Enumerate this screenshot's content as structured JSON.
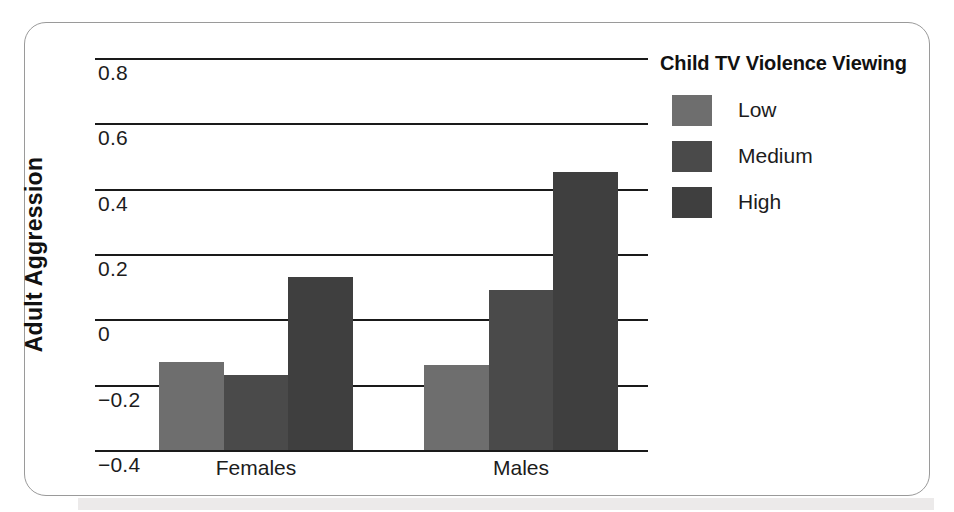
{
  "chart_data": {
    "type": "bar",
    "title": "",
    "xlabel": "",
    "ylabel": "Adult Aggression",
    "categories": [
      "Females",
      "Males"
    ],
    "ylim": [
      -0.4,
      0.8
    ],
    "yticks": [
      "0.8",
      "0.6",
      "0.4",
      "0.2",
      "0",
      "−0.2",
      "−0.4"
    ],
    "ytick_values": [
      0.8,
      0.6,
      0.4,
      0.2,
      0,
      -0.2,
      -0.4
    ],
    "grid": true,
    "legend_position": "right",
    "legend_title": "Child TV Violence Viewing",
    "series": [
      {
        "name": "Low",
        "color": "#6e6e6e",
        "values": [
          -0.13,
          -0.14
        ]
      },
      {
        "name": "Medium",
        "color": "#4a4a4a",
        "values": [
          -0.17,
          0.09
        ]
      },
      {
        "name": "High",
        "color": "#3f3f3f",
        "values": [
          0.13,
          0.45
        ]
      }
    ]
  },
  "axis": {
    "y_title": "Adult Aggression",
    "ticks": [
      {
        "label": "0.8"
      },
      {
        "label": "0.6"
      },
      {
        "label": "0.4"
      },
      {
        "label": "0.2"
      },
      {
        "label": "0"
      },
      {
        "label": "−0.2"
      },
      {
        "label": "−0.4"
      }
    ],
    "categories": [
      {
        "label": "Females"
      },
      {
        "label": "Males"
      }
    ]
  },
  "legend": {
    "title": "Child TV Violence Viewing",
    "items": [
      {
        "label": "Low",
        "color": "#6e6e6e"
      },
      {
        "label": "Medium",
        "color": "#4a4a4a"
      },
      {
        "label": "High",
        "color": "#3f3f3f"
      }
    ]
  }
}
